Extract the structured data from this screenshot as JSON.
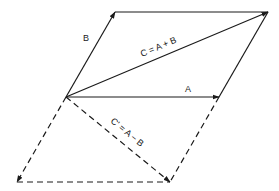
{
  "diagram": {
    "type": "vector-parallelogram",
    "colors": {
      "line": "#1a1a1a",
      "background": "#ffffff"
    },
    "points": {
      "origin": [
        66,
        97
      ],
      "b_tip": [
        115,
        12
      ],
      "sum_tip": [
        268,
        12
      ],
      "a_tip": [
        219,
        97
      ],
      "neg_b_tip": [
        17,
        182
      ],
      "diff_tip": [
        170,
        182
      ]
    },
    "vectors": [
      {
        "id": "B",
        "label": "B",
        "style": "solid"
      },
      {
        "id": "C",
        "label": "C = A + B",
        "style": "solid"
      },
      {
        "id": "A",
        "label": "A",
        "style": "solid"
      },
      {
        "id": "negB",
        "label": "",
        "style": "dashed"
      },
      {
        "id": "Cprime",
        "label": "C' = A − B",
        "style": "dashed"
      }
    ],
    "labels": {
      "b": "B",
      "c": "C = A + B",
      "a": "A",
      "c_prime": "C' = A − B"
    }
  }
}
